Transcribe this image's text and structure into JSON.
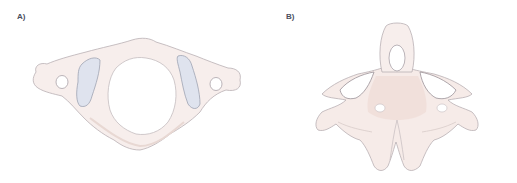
{
  "figure": {
    "panels": [
      {
        "id": "A",
        "label": "A)",
        "subject": "atlas vertebra (C1), superior view"
      },
      {
        "id": "B",
        "label": "B)",
        "subject": "axis vertebra (C2), anterior view"
      }
    ],
    "colors": {
      "bone_fill": "#f7eeec",
      "bone_shade": "#efdcd6",
      "outline": "#b9b0b4",
      "facet_fill": "#dfe3ee",
      "label": "#4a4f5e",
      "background": "#ffffff"
    }
  }
}
